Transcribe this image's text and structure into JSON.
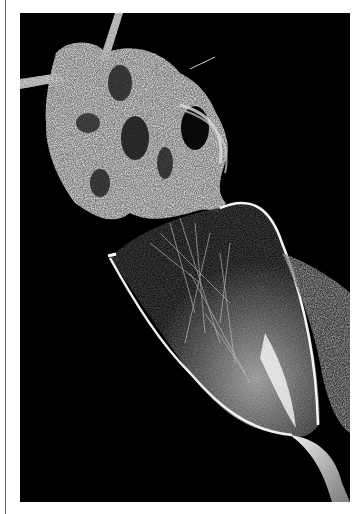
{
  "figure": {
    "background_color": "#000000",
    "page_color": "#ffffff",
    "rule_color": "#6a6a6a",
    "specimen_color": "#e8e8e8"
  }
}
